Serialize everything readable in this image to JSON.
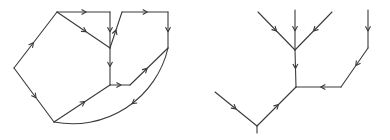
{
  "figure": {
    "background_color": "#ffffff",
    "stroke_color": "#3a3a3a",
    "stroke_width": 1.1,
    "width": 390,
    "height": 140
  },
  "diagrams": [
    {
      "name": "left-diagram",
      "label": "Closed directed circuit with arc",
      "vertices": [
        {
          "id": "A",
          "x": 57,
          "y": 12
        },
        {
          "id": "B",
          "x": 110,
          "y": 12
        },
        {
          "id": "C",
          "x": 110,
          "y": 48
        },
        {
          "id": "D",
          "x": 122,
          "y": 12
        },
        {
          "id": "E",
          "x": 168,
          "y": 12
        },
        {
          "id": "F",
          "x": 168,
          "y": 48
        },
        {
          "id": "G",
          "x": 110,
          "y": 85
        },
        {
          "id": "H",
          "x": 130,
          "y": 85
        },
        {
          "id": "I",
          "x": 14,
          "y": 68
        },
        {
          "id": "J",
          "x": 54,
          "y": 122
        }
      ],
      "edges": [
        {
          "from": "A",
          "to": "B",
          "type": "line",
          "arrow_at": 0.55,
          "direction": "forward"
        },
        {
          "from": "B",
          "to": "C",
          "type": "line",
          "arrow_at": 0.55,
          "direction": "forward"
        },
        {
          "from": "A",
          "to": "C",
          "type": "line",
          "arrow_at": 0.55,
          "direction": "forward"
        },
        {
          "from": "C",
          "to": "D",
          "type": "line",
          "arrow_at": 0.5,
          "direction": "forward"
        },
        {
          "from": "D",
          "to": "E",
          "type": "line",
          "arrow_at": 0.55,
          "direction": "forward"
        },
        {
          "from": "E",
          "to": "F",
          "type": "line",
          "arrow_at": 0.55,
          "direction": "forward"
        },
        {
          "from": "C",
          "to": "G",
          "type": "line",
          "arrow_at": 0.5,
          "direction": "forward"
        },
        {
          "from": "G",
          "to": "H",
          "type": "line",
          "arrow_at": 0.55,
          "direction": "forward"
        },
        {
          "from": "F",
          "to": "H",
          "type": "line",
          "arrow_at": 0.55,
          "direction": "backward"
        },
        {
          "from": "A",
          "to": "I",
          "type": "line",
          "arrow_at": 0.55,
          "direction": "backward"
        },
        {
          "from": "I",
          "to": "J",
          "type": "line",
          "arrow_at": 0.55,
          "direction": "forward"
        },
        {
          "from": "J",
          "to": "G",
          "type": "line",
          "arrow_at": 0.55,
          "direction": "forward"
        },
        {
          "from": "F",
          "to": "J",
          "type": "arc",
          "arrow_at": 0.45,
          "direction": "forward",
          "sweep": "outer"
        }
      ]
    },
    {
      "name": "right-diagram",
      "label": "Branching directed tree",
      "vertices": [
        {
          "id": "P",
          "x": 258,
          "y": 12
        },
        {
          "id": "Q",
          "x": 295,
          "y": 10
        },
        {
          "id": "R",
          "x": 332,
          "y": 12
        },
        {
          "id": "S",
          "x": 295,
          "y": 50
        },
        {
          "id": "T",
          "x": 296,
          "y": 87
        },
        {
          "id": "U",
          "x": 341,
          "y": 87
        },
        {
          "id": "V",
          "x": 368,
          "y": 48
        },
        {
          "id": "W",
          "x": 368,
          "y": 10
        },
        {
          "id": "X",
          "x": 257,
          "y": 126
        },
        {
          "id": "Y",
          "x": 215,
          "y": 92
        }
      ],
      "edges": [
        {
          "from": "P",
          "to": "S",
          "type": "line",
          "arrow_at": 0.5,
          "direction": "forward"
        },
        {
          "from": "Q",
          "to": "S",
          "type": "line",
          "arrow_at": 0.52,
          "direction": "forward"
        },
        {
          "from": "R",
          "to": "S",
          "type": "line",
          "arrow_at": 0.5,
          "direction": "forward"
        },
        {
          "from": "S",
          "to": "T",
          "type": "line",
          "arrow_at": 0.5,
          "direction": "forward"
        },
        {
          "from": "T",
          "to": "U",
          "type": "line",
          "arrow_at": 0.55,
          "direction": "backward"
        },
        {
          "from": "U",
          "to": "V",
          "type": "line",
          "arrow_at": 0.55,
          "direction": "backward"
        },
        {
          "from": "W",
          "to": "V",
          "type": "line",
          "arrow_at": 0.55,
          "direction": "forward"
        },
        {
          "from": "X",
          "to": "T",
          "type": "line",
          "arrow_at": 0.55,
          "direction": "forward"
        },
        {
          "from": "Y",
          "to": "X",
          "type": "line",
          "arrow_at": 0.5,
          "direction": "forward"
        },
        {
          "from": "X",
          "to": "X2",
          "type": "stub",
          "arrow_at": 0.5,
          "direction": "forward"
        }
      ],
      "stub": {
        "x1": 257,
        "y1": 126,
        "x2": 257,
        "y2": 133
      }
    }
  ]
}
